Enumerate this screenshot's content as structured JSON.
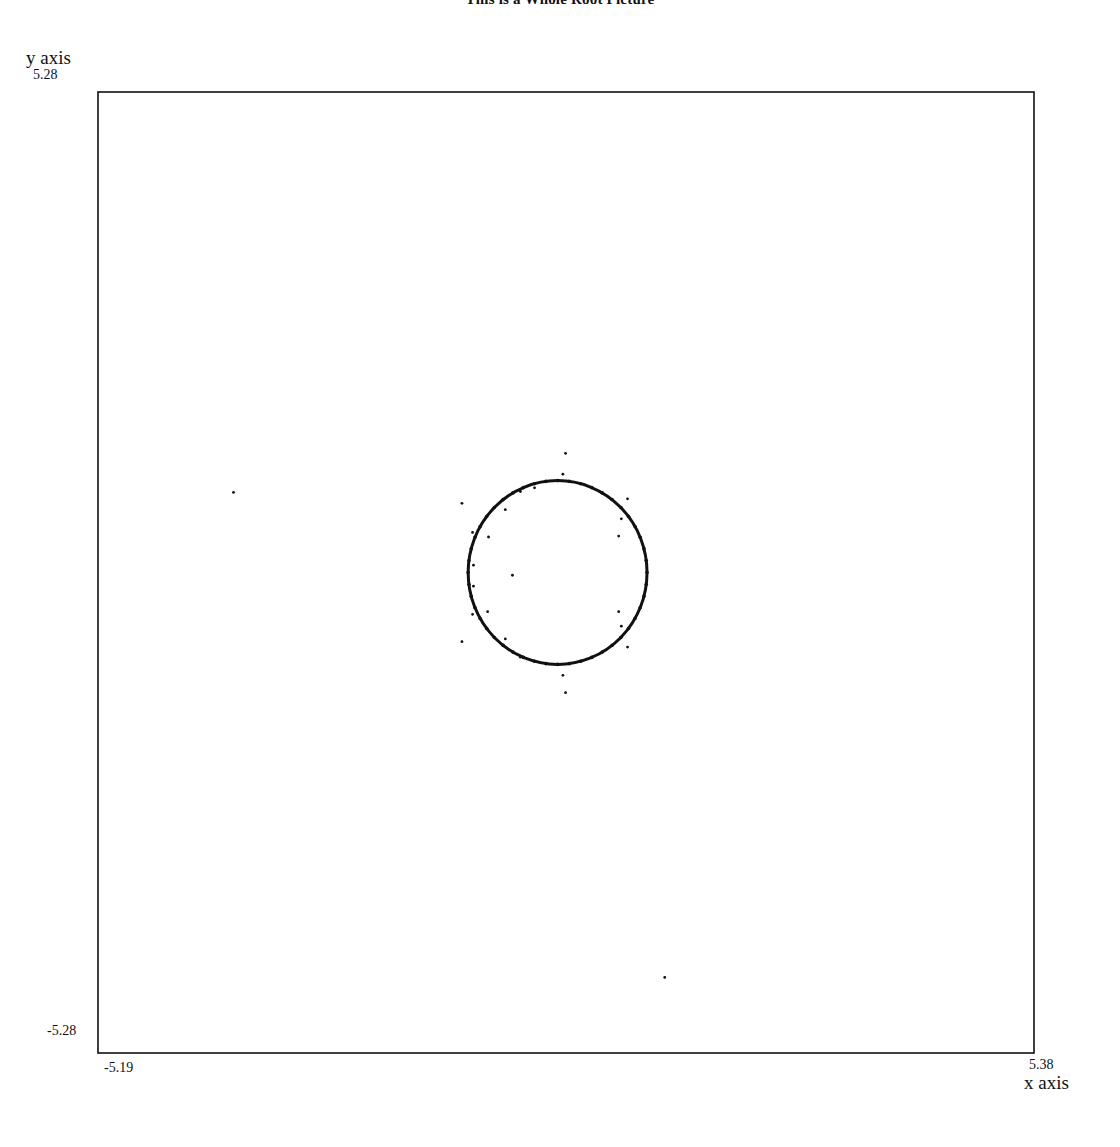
{
  "chart_data": {
    "type": "scatter",
    "title": "This is a Whole Root Picture",
    "xlabel": "x axis",
    "ylabel": "y axis",
    "xlim": [
      -5.19,
      5.38
    ],
    "ylim": [
      -5.28,
      5.28
    ],
    "tick_labels": {
      "x_min": "-5.19",
      "x_max": "5.38",
      "y_min": "-5.28",
      "y_max": "5.28"
    },
    "grid": false,
    "legend": null,
    "series": [
      {
        "name": "roots on unit-like circle",
        "kind": "dense-curve",
        "shape": "circle",
        "center": [
          -0.0,
          -0.0
        ],
        "radius": 1.01
      },
      {
        "name": "isolated roots",
        "kind": "points",
        "points": [
          [
            0.09,
            1.31
          ],
          [
            0.06,
            1.08
          ],
          [
            -0.26,
            0.93
          ],
          [
            -0.42,
            0.89
          ],
          [
            -0.59,
            0.69
          ],
          [
            -1.08,
            0.76
          ],
          [
            -0.96,
            0.44
          ],
          [
            -0.78,
            0.39
          ],
          [
            -0.95,
            0.08
          ],
          [
            -0.95,
            -0.15
          ],
          [
            -0.51,
            -0.03
          ],
          [
            -0.96,
            -0.46
          ],
          [
            -0.79,
            -0.43
          ],
          [
            -1.08,
            -0.76
          ],
          [
            -0.59,
            -0.73
          ],
          [
            -0.42,
            -0.93
          ],
          [
            0.06,
            -1.13
          ],
          [
            0.09,
            -1.32
          ],
          [
            0.79,
            0.81
          ],
          [
            0.72,
            0.59
          ],
          [
            0.69,
            0.4
          ],
          [
            0.69,
            -0.43
          ],
          [
            0.72,
            -0.59
          ],
          [
            0.79,
            -0.82
          ],
          [
            -3.66,
            0.88
          ],
          [
            1.21,
            -4.45
          ]
        ]
      }
    ]
  },
  "plot_frame": {
    "left_px": 98,
    "top_px": 92,
    "right_px": 1034,
    "bottom_px": 1053
  },
  "colors": {
    "ink": "#111111",
    "background": "#ffffff"
  }
}
